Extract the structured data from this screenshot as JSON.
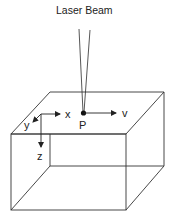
{
  "title": "Laser Beam",
  "point_label": "P",
  "velocity_label": "v",
  "axes": {
    "x": "x",
    "y": "y",
    "z": "z"
  },
  "colors": {
    "line": "#333333",
    "text": "#222222",
    "background": "#ffffff"
  }
}
